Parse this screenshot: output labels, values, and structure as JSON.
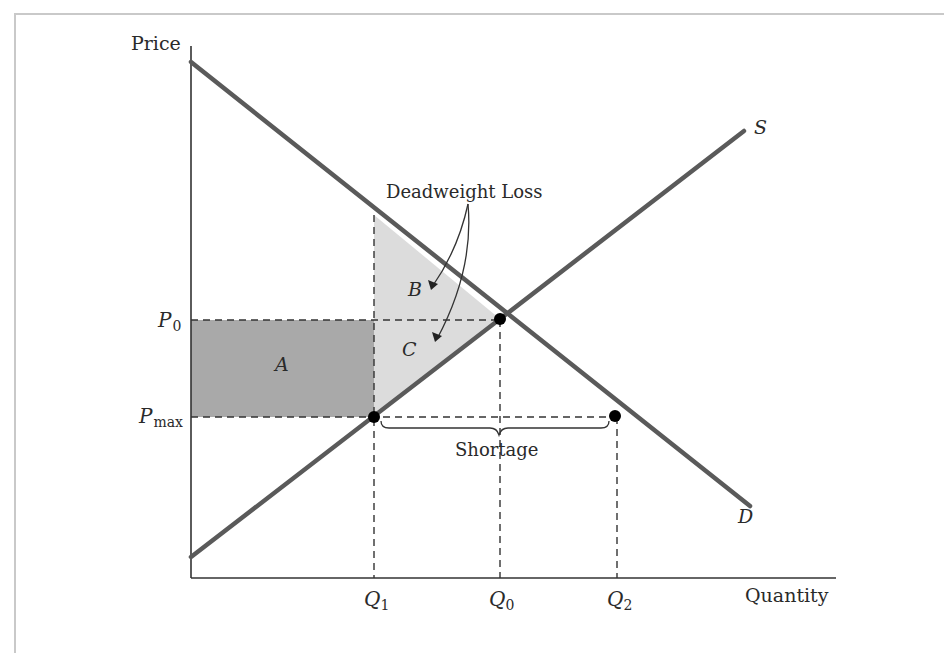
{
  "diagram": {
    "type": "supply-demand price ceiling",
    "axes": {
      "y_label": "Price",
      "x_label": "Quantity"
    },
    "curves": {
      "supply_label": "S",
      "demand_label": "D"
    },
    "price_levels": {
      "p0_main": "P",
      "p0_sub": "0",
      "pmax_main": "P",
      "pmax_sub": "max"
    },
    "quantity_levels": {
      "q1_main": "Q",
      "q1_sub": "1",
      "q0_main": "Q",
      "q0_sub": "0",
      "q2_main": "Q",
      "q2_sub": "2"
    },
    "regions": {
      "a": "A",
      "b": "B",
      "c": "C"
    },
    "annotations": {
      "deadweight_loss": "Deadweight Loss",
      "shortage": "Shortage"
    },
    "colors": {
      "curve": "#5a5a5a",
      "axis": "#333333",
      "region_a": "#a9a9a9",
      "region_bc": "#dcdcdc",
      "point": "#000000",
      "frame": "#c9c9c9"
    }
  }
}
